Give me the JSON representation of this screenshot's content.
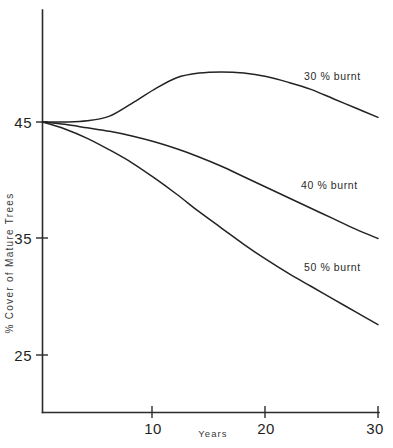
{
  "chart_data": {
    "type": "line",
    "title": "",
    "subtitle": "",
    "xlabel": "Years",
    "ylabel": "% Cover of Mature Trees",
    "xlim": [
      0,
      30
    ],
    "ylim": [
      21,
      51
    ],
    "grid": false,
    "legend_position": "inline-right-of-curves",
    "x_ticks": [
      {
        "value": 10,
        "label": "10"
      },
      {
        "value": 20,
        "label": "20"
      },
      {
        "value": 30,
        "label": "30"
      }
    ],
    "y_ticks": [
      {
        "value": 45,
        "label": "45"
      },
      {
        "value": 35,
        "label": "35"
      },
      {
        "value": 25,
        "label": "25"
      }
    ],
    "x": [
      0,
      2,
      4,
      6,
      8,
      10,
      12,
      14,
      16,
      18,
      20,
      22,
      24,
      26,
      28,
      30
    ],
    "series": [
      {
        "name": "30 % burnt",
        "label": "30 % burnt",
        "color": "#232323",
        "values": [
          45.0,
          45.0,
          45.1,
          45.5,
          46.6,
          47.8,
          48.8,
          49.2,
          49.3,
          49.2,
          48.9,
          48.4,
          47.8,
          47.0,
          46.2,
          45.4
        ]
      },
      {
        "name": "40 % burnt",
        "label": "40 % burnt",
        "color": "#232323",
        "values": [
          45.0,
          44.8,
          44.5,
          44.2,
          43.8,
          43.3,
          42.7,
          42.0,
          41.2,
          40.3,
          39.4,
          38.5,
          37.6,
          36.7,
          35.8,
          35.0
        ]
      },
      {
        "name": "50 % burnt",
        "label": "50 % burnt",
        "color": "#232323",
        "values": [
          45.0,
          44.4,
          43.6,
          42.6,
          41.5,
          40.2,
          38.8,
          37.3,
          35.9,
          34.5,
          33.2,
          32.0,
          30.9,
          29.8,
          28.7,
          27.6
        ]
      }
    ],
    "annotations": [
      {
        "text": "30 % burnt",
        "x": 23.5,
        "y": 49.4
      },
      {
        "text": "40 % burnt",
        "x": 23.3,
        "y": 39.8
      },
      {
        "text": "50 % burnt",
        "x": 23.6,
        "y": 32.8
      }
    ]
  },
  "axis": {
    "y_label": "% Cover of Mature Trees",
    "x_label": "Years",
    "y_tick_45": "45",
    "y_tick_35": "35",
    "y_tick_25": "25",
    "x_tick_10": "10",
    "x_tick_20": "20",
    "x_tick_30": "30"
  },
  "series_labels": {
    "burnt_30": "30 % burnt",
    "burnt_40": "40 % burnt",
    "burnt_50": "50 % burnt"
  },
  "colors": {
    "curve": "#232323",
    "axis": "#2b2b2b",
    "text": "#1f1f1f",
    "background": "#ffffff"
  }
}
